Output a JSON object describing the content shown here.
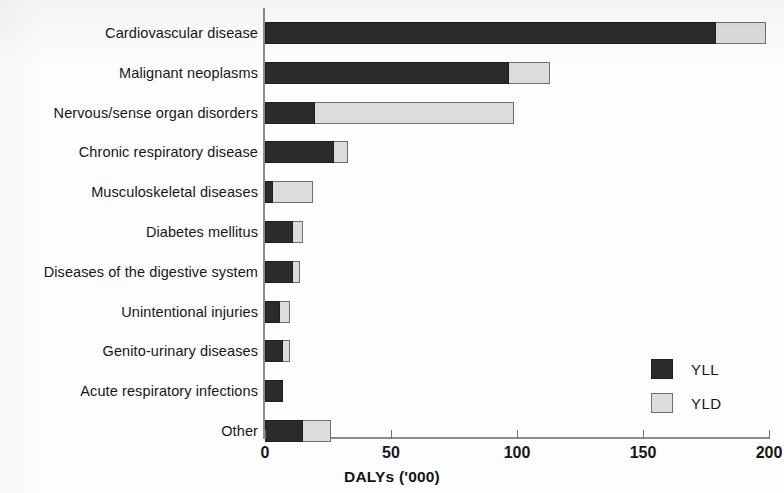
{
  "chart_data": {
    "type": "bar",
    "orientation": "horizontal",
    "stacked": true,
    "title": "",
    "xlabel": "DALYs ('000)",
    "ylabel": "",
    "xlim": [
      0,
      200
    ],
    "xticks": [
      0,
      50,
      100,
      150,
      200
    ],
    "xtick_labels": [
      "0",
      "50",
      "100",
      "150",
      "200"
    ],
    "grid": false,
    "legend_position": "lower-right",
    "categories": [
      "Cardiovascular disease",
      "Malignant neoplasms",
      "Nervous/sense organ disorders",
      "Chronic respiratory disease",
      "Musculoskeletal diseases",
      "Diabetes mellitus",
      "Diseases of the digestive system",
      "Unintentional injuries",
      "Genito-urinary diseases",
      "Acute respiratory infections",
      "Other"
    ],
    "series": [
      {
        "name": "YLL",
        "color": "#2b2b2b",
        "values": [
          179,
          97,
          20,
          27.5,
          3,
          11,
          11,
          6,
          7,
          7,
          15
        ]
      },
      {
        "name": "YLD",
        "color": "#dcdcdc",
        "values": [
          20,
          16,
          79,
          5.5,
          16,
          4,
          3,
          4,
          3,
          0,
          11
        ]
      }
    ],
    "totals": [
      199,
      113,
      99,
      33,
      19,
      15,
      14,
      10,
      10,
      7,
      26
    ]
  },
  "legend": {
    "items": [
      {
        "label": "YLL",
        "swatch": "yll"
      },
      {
        "label": "YLD",
        "swatch": "yld"
      }
    ]
  }
}
